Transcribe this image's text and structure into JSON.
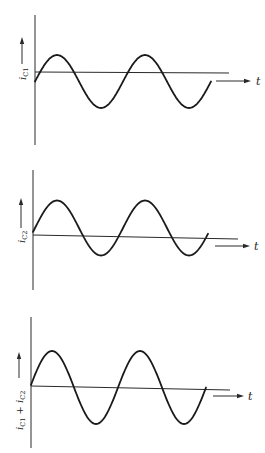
{
  "figure": {
    "panels": [
      {
        "id": "ic1",
        "ylabel": {
          "main": "i",
          "sub": "C1",
          "extra": ""
        },
        "xlabel": "t",
        "geom": {
          "vaxis": {
            "x": 35,
            "y1": 15,
            "y2": 145
          },
          "haxis": {
            "x1": 35,
            "y1": 72,
            "x2": 229,
            "y2": 73
          },
          "t_arrow": {
            "x1": 216,
            "x2": 251,
            "y": 81,
            "label_x": 256
          },
          "y_arrow": {
            "x": 22,
            "y_tail": 64,
            "y_head": 37,
            "label_y": 80
          },
          "wave": {
            "x0": 35,
            "x1": 211,
            "period": 88,
            "center": 81.5,
            "amp": 26.5,
            "phase_x": 57
          }
        }
      },
      {
        "id": "ic2",
        "ylabel": {
          "main": "i",
          "sub": "C2",
          "extra": ""
        },
        "xlabel": "t",
        "geom": {
          "vaxis": {
            "x": 33,
            "y1": 170,
            "y2": 290
          },
          "haxis": {
            "x1": 33,
            "y1": 235,
            "x2": 238,
            "y2": 239
          },
          "t_arrow": {
            "x1": 215,
            "x2": 250,
            "y": 246,
            "label_x": 254
          },
          "y_arrow": {
            "x": 21,
            "y_tail": 228,
            "y_head": 198,
            "label_y": 243
          },
          "wave": {
            "x0": 33,
            "x1": 208,
            "period": 88,
            "center": 228,
            "amp": 27.5,
            "phase_x": 57
          }
        }
      },
      {
        "id": "ic1_plus_ic2",
        "ylabel": {
          "main": "i",
          "sub": "C1",
          "extra": "+ i",
          "sub2": "C2"
        },
        "xlabel": "t",
        "geom": {
          "vaxis": {
            "x": 31,
            "y1": 317,
            "y2": 448
          },
          "haxis": {
            "x1": 31,
            "y1": 386,
            "x2": 230,
            "y2": 390
          },
          "t_arrow": {
            "x1": 213,
            "x2": 244,
            "y": 396,
            "label_x": 248
          },
          "y_arrow": {
            "x": 19,
            "y_tail": 378,
            "y_head": 352,
            "label_y": 430
          },
          "wave": {
            "x0": 31,
            "x1": 206,
            "period": 88,
            "center": 387.5,
            "amp": 36.5,
            "phase_x": 52
          }
        }
      }
    ]
  },
  "chart_data": [
    {
      "type": "line",
      "title": "",
      "xlabel": "t",
      "ylabel": "i_C1",
      "description": "Sinusoid with positive DC offset relative to drawn axis: small positive lobes, larger negative lobes; two cycles",
      "x": [
        0,
        0.25,
        0.75,
        1.25,
        1.75,
        2.0
      ],
      "y": [
        0,
        0.6,
        -1.4,
        0.6,
        -1.4,
        0
      ],
      "grid": false
    },
    {
      "type": "line",
      "title": "",
      "xlabel": "t",
      "ylabel": "i_C2",
      "description": "Sinusoid with negative DC offset relative to drawn axis: large positive lobes, small negative lobes; two cycles",
      "x": [
        0,
        0.25,
        0.75,
        1.25,
        1.75,
        2.0
      ],
      "y": [
        0,
        1.4,
        -0.6,
        1.4,
        -0.6,
        0
      ],
      "grid": false
    },
    {
      "type": "line",
      "title": "",
      "xlabel": "t",
      "ylabel": "i_C1 + i_C2",
      "description": "Sum is a pure sinusoid symmetric about the axis; two cycles",
      "x": [
        0,
        0.25,
        0.75,
        1.25,
        1.75,
        2.0
      ],
      "y": [
        0,
        1.0,
        -1.0,
        1.0,
        -1.0,
        0
      ],
      "grid": false
    }
  ]
}
